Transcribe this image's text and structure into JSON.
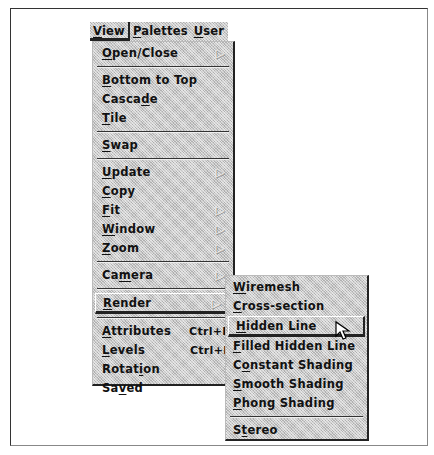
{
  "menubar": {
    "items": [
      {
        "label": "View",
        "mnemonic_index": 0,
        "active": true
      },
      {
        "label": "Palettes",
        "mnemonic_index": 0,
        "active": false
      },
      {
        "label": "User",
        "mnemonic_index": 0,
        "active": false
      }
    ]
  },
  "view_menu": {
    "groups": [
      [
        {
          "label": "Open/Close",
          "mnemonic": "O",
          "submenu": true
        }
      ],
      [
        {
          "label": "Bottom to Top",
          "mnemonic": "B"
        },
        {
          "label": "Cascade",
          "mnemonic": "d"
        },
        {
          "label": "Tile",
          "mnemonic": "T"
        }
      ],
      [
        {
          "label": "Swap",
          "mnemonic": "S"
        }
      ],
      [
        {
          "label": "Update",
          "mnemonic": "U",
          "submenu": true
        },
        {
          "label": "Copy",
          "mnemonic": "C"
        },
        {
          "label": "Fit",
          "mnemonic": "F",
          "submenu": true
        },
        {
          "label": "Window",
          "mnemonic": "W",
          "submenu": true
        },
        {
          "label": "Zoom",
          "mnemonic": "Z",
          "submenu": true
        }
      ],
      [
        {
          "label": "Camera",
          "mnemonic": "m",
          "submenu": true
        }
      ],
      [
        {
          "label": "Render",
          "mnemonic": "R",
          "submenu": true,
          "selected": true
        }
      ],
      [
        {
          "label": "Attributes",
          "mnemonic": "A",
          "accelerator": "Ctrl+B"
        },
        {
          "label": "Levels",
          "mnemonic": "L",
          "accelerator": "Ctrl+E"
        },
        {
          "label": "Rotation",
          "mnemonic": "i"
        },
        {
          "label": "Saved",
          "mnemonic": "v"
        }
      ]
    ]
  },
  "render_submenu": {
    "groups": [
      [
        {
          "label": "Wiremesh",
          "mnemonic": "W"
        },
        {
          "label": "Cross-section",
          "mnemonic": "C"
        },
        {
          "label": "Hidden Line",
          "mnemonic": "H",
          "selected": true
        },
        {
          "label": "Filled Hidden Line",
          "mnemonic": "F"
        },
        {
          "label": "Constant Shading",
          "mnemonic": "o"
        },
        {
          "label": "Smooth Shading",
          "mnemonic": "S"
        },
        {
          "label": "Phong Shading",
          "mnemonic": "P"
        }
      ],
      [
        {
          "label": "Stereo",
          "mnemonic": "t"
        }
      ]
    ]
  },
  "icons": {
    "submenu_arrow": "▷",
    "pointer": "mouse-pointer-icon"
  }
}
